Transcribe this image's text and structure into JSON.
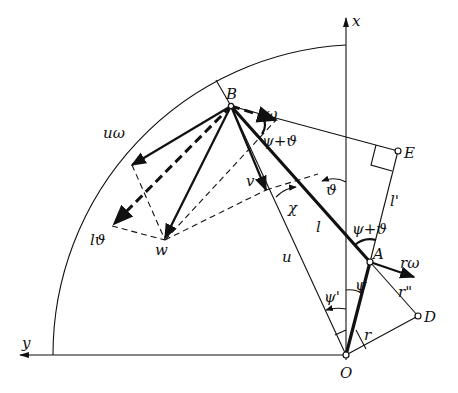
{
  "figure": {
    "type": "vector-kinematics-diagram",
    "axes": {
      "x_label": "x",
      "y_label": "y",
      "origin_label": "O"
    },
    "points": [
      {
        "id": "O",
        "label": "O"
      },
      {
        "id": "A",
        "label": "A"
      },
      {
        "id": "B",
        "label": "B"
      },
      {
        "id": "E",
        "label": "E"
      },
      {
        "id": "D",
        "label": "D"
      },
      {
        "id": "w",
        "label": "w"
      }
    ],
    "segment_labels": {
      "l": "l",
      "l_prime": "l'",
      "r": "r",
      "r_double_prime": "r\"",
      "u": "u",
      "v": "v"
    },
    "vector_labels": {
      "r_omega_B": "rω",
      "r_omega_A": "rω",
      "u_omega": "uω",
      "l_theta": "lϑ",
      "w": "w",
      "v": "v"
    },
    "angle_labels": {
      "psi_plus_theta_B": "ψ+ϑ",
      "psi_plus_theta_A": "ψ+ϑ",
      "theta": "ϑ",
      "chi": "χ",
      "psi": "ψ",
      "psi_prime": "ψ'"
    },
    "colors": {
      "ink": "#111111",
      "background": "#ffffff"
    }
  }
}
